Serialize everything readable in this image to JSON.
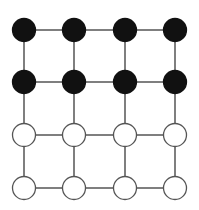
{
  "diagram": {
    "type": "grid-graph",
    "rows": 4,
    "cols": 4,
    "col_x": [
      24,
      74,
      125,
      175
    ],
    "row_y": [
      30,
      82,
      135,
      188
    ],
    "node_radius": 11.5,
    "colors": {
      "background": "#ffffff",
      "edge": "#555555",
      "filled_node": "#111111",
      "filled_stroke": "#111111",
      "empty_node": "#ffffff",
      "empty_stroke": "#555555"
    },
    "node_states": [
      [
        "filled",
        "filled",
        "filled",
        "filled"
      ],
      [
        "filled",
        "filled",
        "filled",
        "filled"
      ],
      [
        "empty",
        "empty",
        "empty",
        "empty"
      ],
      [
        "empty",
        "empty",
        "empty",
        "empty"
      ]
    ]
  }
}
